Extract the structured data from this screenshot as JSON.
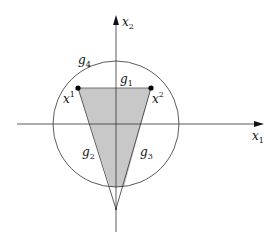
{
  "diagram": {
    "axes": {
      "x_label": "x",
      "x_sub": "1",
      "y_label": "x",
      "y_sub": "2"
    },
    "points": [
      {
        "label": "x",
        "sup": "1"
      },
      {
        "label": "x",
        "sup": "2"
      }
    ],
    "constraints": [
      {
        "label": "g",
        "sub": "1"
      },
      {
        "label": "g",
        "sub": "2"
      },
      {
        "label": "g",
        "sub": "3"
      },
      {
        "label": "g",
        "sub": "4"
      }
    ],
    "colors": {
      "shade": "#c8c8c8",
      "line": "#333333"
    }
  }
}
